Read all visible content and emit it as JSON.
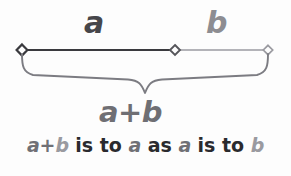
{
  "figure": {
    "background_color": "#fdfdfd",
    "width": 291,
    "height": 176
  },
  "colors": {
    "segment_a_stroke": "#3a3a3e",
    "segment_b_stroke": "#9a9aa0",
    "brace_stroke": "#7c7c82",
    "label_a": "#46464a",
    "label_b": "#8d8d92",
    "label_sum": "#6f6f74",
    "text_dark": "#2a2a2e",
    "text_mid": "#707075",
    "text_light": "#9a9aa0"
  },
  "labels": {
    "segment_a": "a",
    "segment_b": "b",
    "brace_total": "a+b"
  },
  "caption": {
    "full_text": "a+b is to a as a is to b",
    "tokens": [
      {
        "text": "a",
        "style": "var",
        "shade": "mid"
      },
      {
        "text": "+",
        "style": "sym",
        "shade": "mid"
      },
      {
        "text": "b",
        "style": "var",
        "shade": "light"
      },
      {
        "text": " is to ",
        "style": "word",
        "shade": "dark"
      },
      {
        "text": "a",
        "style": "var",
        "shade": "mid"
      },
      {
        "text": " as ",
        "style": "word",
        "shade": "dark"
      },
      {
        "text": "a",
        "style": "var",
        "shade": "mid"
      },
      {
        "text": " is to ",
        "style": "word",
        "shade": "dark"
      },
      {
        "text": "b",
        "style": "var",
        "shade": "light"
      }
    ]
  },
  "geometry": {
    "line_y": 50,
    "point_left_x": 22,
    "point_mid_x": 175,
    "point_right_x": 268,
    "brace_tip_x": 145,
    "brace_top_y": 54,
    "brace_bottom_y": 93
  },
  "chart_data": {
    "type": "line",
    "title": "a+b is to a as a is to b",
    "segments": [
      {
        "name": "a",
        "start_x": 22,
        "end_x": 175,
        "length": 153,
        "color": "#3a3a3e",
        "label": "a"
      },
      {
        "name": "b",
        "start_x": 175,
        "end_x": 268,
        "length": 93,
        "color": "#9a9aa0",
        "label": "b"
      },
      {
        "name": "a+b",
        "start_x": 22,
        "end_x": 268,
        "length": 246,
        "color": "#7c7c82",
        "label": "a+b"
      }
    ],
    "markers": [
      {
        "x": 22,
        "y": 50,
        "shape": "diamond",
        "color": "#3a3a3e"
      },
      {
        "x": 175,
        "y": 50,
        "shape": "diamond",
        "color": "#55555a"
      },
      {
        "x": 268,
        "y": 50,
        "shape": "diamond",
        "color": "#9a9aa0"
      }
    ],
    "ratio_note": "(a+b)/a = a/b",
    "xlabel": "",
    "ylabel": "",
    "legend": "none",
    "grid": false
  }
}
